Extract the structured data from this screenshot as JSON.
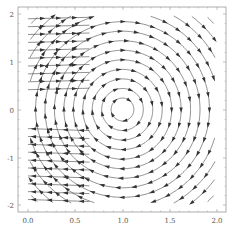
{
  "chart_data": {
    "type": "streamplot",
    "title": "",
    "xlabel": "",
    "ylabel": "",
    "xlim": [
      0.0,
      2.0
    ],
    "ylim": [
      -2.0,
      2.0
    ],
    "x_ticks": [
      "0.0",
      "0.5",
      "1.0",
      "1.5",
      "2.0"
    ],
    "y_ticks": [
      "2",
      "1",
      "0",
      "-1",
      "-2"
    ],
    "grid": false,
    "legend": null,
    "field": {
      "description": "Clockwise circulation around a center near (1.0, 0)",
      "center": [
        1.0,
        0.0
      ],
      "vx": "y",
      "vy": "-(x - 1)",
      "direction": "clockwise"
    },
    "colors": {
      "stream": "#333333",
      "frame": "#999999",
      "text": "#555555"
    }
  },
  "frame": {
    "left": 18,
    "top": 7,
    "right": 226,
    "bottom": 212
  },
  "axes": {
    "x_tick_px": [
      28,
      75,
      123,
      170,
      217
    ],
    "y_tick_px": [
      14,
      62,
      110,
      158,
      205
    ]
  }
}
